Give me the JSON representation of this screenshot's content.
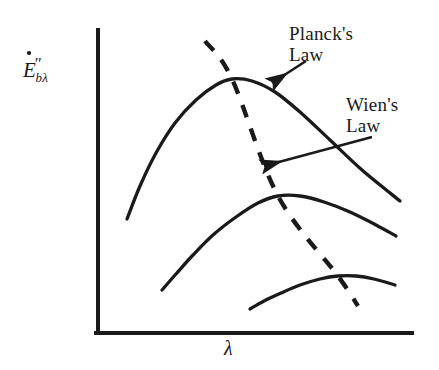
{
  "figure": {
    "background_color": "#ffffff",
    "ink_color": "#1a1a1a"
  },
  "axes": {
    "y_label_base": "E",
    "y_label_prime": "″",
    "y_label_subscript": "bλ",
    "y_label_full": "Ė″bλ",
    "x_label": "λ",
    "origin": {
      "x": 98,
      "y": 333
    },
    "y_axis_top": {
      "x": 98,
      "y": 30
    },
    "x_axis_right": {
      "x": 412,
      "y": 333
    },
    "line_width": 4,
    "ticks": false,
    "grid": false
  },
  "annotations": [
    {
      "name": "planck-law",
      "line1": "Planck's",
      "line2": "Law",
      "arrow_from": {
        "x": 306,
        "y": 61
      },
      "arrow_to": {
        "x": 272,
        "y": 83
      }
    },
    {
      "name": "wien-law",
      "line1": "Wien's",
      "line2": "Law",
      "arrow_from": {
        "x": 372,
        "y": 137
      },
      "arrow_to": {
        "x": 264,
        "y": 166
      }
    }
  ],
  "chart_data": {
    "type": "line",
    "xlabel": "λ",
    "ylabel": "Ė″bλ",
    "grid": false,
    "legend": "none",
    "axis_ticks": "none",
    "series": [
      {
        "name": "Planck curve - highest temperature",
        "style": "solid",
        "peak": {
          "x": 232,
          "y": 79
        },
        "points": [
          {
            "x": 127,
            "y": 219
          },
          {
            "x": 140,
            "y": 186
          },
          {
            "x": 156,
            "y": 153
          },
          {
            "x": 175,
            "y": 123
          },
          {
            "x": 196,
            "y": 100
          },
          {
            "x": 216,
            "y": 85
          },
          {
            "x": 232,
            "y": 79
          },
          {
            "x": 252,
            "y": 81
          },
          {
            "x": 275,
            "y": 92
          },
          {
            "x": 300,
            "y": 112
          },
          {
            "x": 330,
            "y": 140
          },
          {
            "x": 362,
            "y": 170
          },
          {
            "x": 400,
            "y": 201
          }
        ]
      },
      {
        "name": "Planck curve - middle temperature",
        "style": "solid",
        "peak": {
          "x": 278,
          "y": 196
        },
        "points": [
          {
            "x": 162,
            "y": 290
          },
          {
            "x": 176,
            "y": 274
          },
          {
            "x": 193,
            "y": 255
          },
          {
            "x": 213,
            "y": 235
          },
          {
            "x": 236,
            "y": 217
          },
          {
            "x": 258,
            "y": 203
          },
          {
            "x": 278,
            "y": 196
          },
          {
            "x": 300,
            "y": 196
          },
          {
            "x": 324,
            "y": 202
          },
          {
            "x": 350,
            "y": 212
          },
          {
            "x": 376,
            "y": 225
          },
          {
            "x": 396,
            "y": 236
          }
        ]
      },
      {
        "name": "Planck curve - lowest temperature",
        "style": "solid",
        "peak": {
          "x": 338,
          "y": 276
        },
        "points": [
          {
            "x": 250,
            "y": 309
          },
          {
            "x": 264,
            "y": 301
          },
          {
            "x": 281,
            "y": 293
          },
          {
            "x": 300,
            "y": 285
          },
          {
            "x": 320,
            "y": 279
          },
          {
            "x": 338,
            "y": 276
          },
          {
            "x": 356,
            "y": 276
          },
          {
            "x": 374,
            "y": 279
          },
          {
            "x": 395,
            "y": 285
          }
        ]
      }
    ],
    "wien_line": {
      "name": "Wien's displacement law locus",
      "style": "dashed",
      "dash_pattern": "13 12",
      "points": [
        {
          "x": 205,
          "y": 41
        },
        {
          "x": 232,
          "y": 79
        },
        {
          "x": 278,
          "y": 196
        },
        {
          "x": 338,
          "y": 276
        },
        {
          "x": 358,
          "y": 306
        }
      ]
    }
  }
}
